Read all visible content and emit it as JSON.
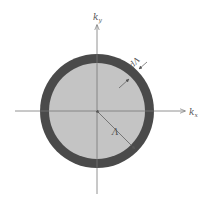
{
  "diagram": {
    "title": "",
    "axes": {
      "x_label": "k",
      "x_sub": "x",
      "y_label": "k",
      "y_sub": "y"
    },
    "labels": {
      "radius": "Λ",
      "shell_width": "dΛ"
    },
    "colors": {
      "inner_disk": "#c4c4c4",
      "shell": "#4a4a4a",
      "axis": "#777777",
      "background": "#ffffff"
    },
    "geometry": {
      "center": [
        97,
        111
      ],
      "inner_radius": 48,
      "outer_radius": 57
    }
  }
}
